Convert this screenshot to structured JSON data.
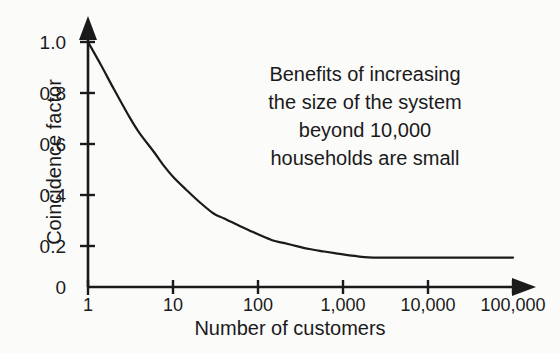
{
  "chart_data": {
    "type": "line",
    "title": "",
    "xlabel": "Number of customers",
    "ylabel": "Coincidence factor",
    "xscale": "log",
    "xlim": [
      1,
      100000
    ],
    "ylim": [
      0,
      1.05
    ],
    "grid": false,
    "legend": "none",
    "xticklabels": [
      "1",
      "10",
      "100",
      "1,000",
      "10,000",
      "100,000"
    ],
    "xtickvalues": [
      1,
      10,
      100,
      1000,
      10000,
      100000
    ],
    "yticklabels": [
      "0",
      "0.2",
      "0.4",
      "0.6",
      "0.8",
      "1.0"
    ],
    "ytickvalues": [
      0,
      0.2,
      0.4,
      0.6,
      0.8,
      1.0
    ],
    "series": [
      {
        "name": "Coincidence factor",
        "color": "#1a1a1a",
        "x": [
          1,
          1.4,
          2,
          3,
          4,
          6,
          8,
          10,
          14,
          20,
          30,
          40,
          60,
          80,
          100,
          150,
          200,
          300,
          400,
          600,
          800,
          1000,
          1500,
          2000,
          3000,
          5000,
          10000,
          20000,
          50000,
          100000
        ],
        "y": [
          1.0,
          0.91,
          0.81,
          0.7,
          0.63,
          0.55,
          0.49,
          0.45,
          0.4,
          0.35,
          0.3,
          0.28,
          0.25,
          0.23,
          0.215,
          0.19,
          0.18,
          0.165,
          0.155,
          0.145,
          0.138,
          0.133,
          0.125,
          0.121,
          0.12,
          0.12,
          0.12,
          0.12,
          0.12,
          0.12
        ]
      }
    ],
    "annotations": [
      {
        "name": "benefits-note",
        "lines": [
          "Benefits of increasing",
          "the size of the system",
          "beyond 10,000",
          "households are small"
        ]
      }
    ],
    "axis_style": {
      "arrow_heads": true,
      "spines": [
        "left",
        "bottom"
      ],
      "line_color": "#1a1a1a"
    }
  }
}
